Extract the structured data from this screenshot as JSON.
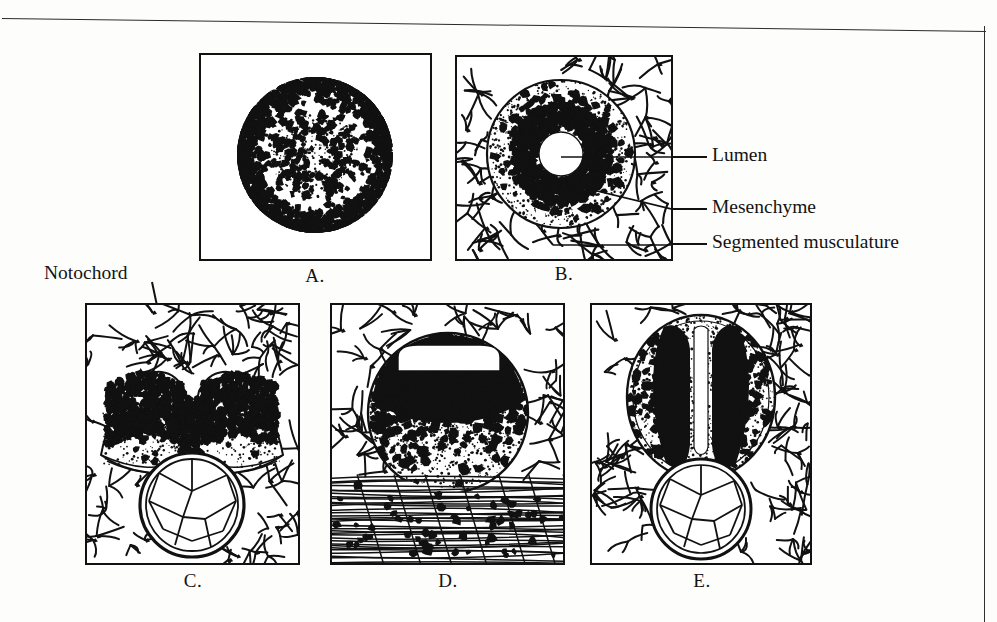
{
  "figure": {
    "kind": "scientific-illustration",
    "background_color": "#fdfdfb",
    "ink_color": "#111111"
  },
  "panels": [
    {
      "id": "A",
      "letter": "A.",
      "description": "Solid rounded neural keel / medullary cord in cross section, dense peripheral cells, no lumen",
      "features": [
        "peripheral dense cell layer",
        "pale stippled core",
        "scattered dark nuclei"
      ]
    },
    {
      "id": "B",
      "letter": "B.",
      "description": "Neural tube with small round central lumen, surrounded by mesenchyme and segmented musculature",
      "features": [
        "round central lumen",
        "dense nuclear ring",
        "stippled mantle",
        "surrounding mesenchyme network"
      ]
    },
    {
      "id": "C",
      "letter": "C.",
      "description": "Open neural groove (two raised neural folds) above the notochord",
      "features": [
        "paired neural folds",
        "V-shaped median groove",
        "notochord with vacuolated polygonal cells"
      ]
    },
    {
      "id": "D",
      "letter": "D.",
      "description": "Neural tube with transverse slit-like lumen resting on segmented musculature",
      "features": [
        "horizontal slit lumen",
        "dense dorsal cell mass",
        "fibrous segmented musculature below"
      ]
    },
    {
      "id": "E",
      "letter": "E.",
      "description": "Oval neural tube with narrow vertical median lumen above the notochord",
      "features": [
        "vertical slit lumen",
        "bilateral nuclear columns",
        "notochord with polygonal cells"
      ]
    }
  ],
  "labels": [
    {
      "id": "notochord",
      "text": "Notochord",
      "points_to_panel": "C",
      "target": "notochord"
    },
    {
      "id": "lumen",
      "text": "Lumen",
      "points_to_panel": "B",
      "target": "central lumen"
    },
    {
      "id": "mesenchyme",
      "text": "Mesenchyme",
      "points_to_panel": "B",
      "target": "mesenchyme"
    },
    {
      "id": "segmented-musculature",
      "text": "Segmented musculature",
      "points_to_panel": "B",
      "target": "segmented musculature"
    }
  ]
}
